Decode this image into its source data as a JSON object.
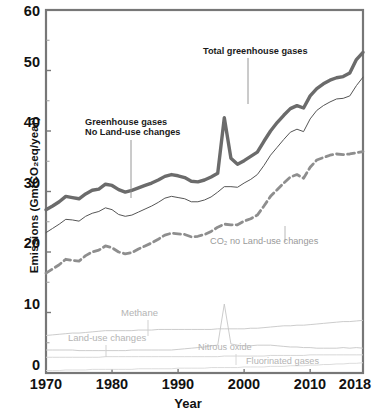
{
  "chart_data": {
    "type": "line",
    "title": "",
    "xlabel": "Year",
    "ylabel": "Emissions (GmtCO₂eq/year)",
    "xlim": [
      1970,
      2018
    ],
    "ylim": [
      0,
      60
    ],
    "yticks": [
      0,
      10,
      20,
      30,
      40,
      50,
      60
    ],
    "xticks": [
      1970,
      1980,
      1990,
      2000,
      2010,
      2018
    ],
    "grid": false,
    "legend": "inline annotations",
    "annotations": [
      {
        "name": "total-greenhouse-gases",
        "text": "Total greenhouse gases",
        "style": "dark"
      },
      {
        "name": "greenhouse-gases-no-landuse",
        "text": "Greenhouse gases\nNo Land-use changes",
        "style": "dark"
      },
      {
        "name": "co2-no-landuse",
        "text": "CO₂ no Land-use changes",
        "style": "gray"
      },
      {
        "name": "methane",
        "text": "Methane",
        "style": "graylight"
      },
      {
        "name": "land-use-changes",
        "text": "Land-use changes",
        "style": "graylight"
      },
      {
        "name": "nitrous-oxide",
        "text": "Nitrous oxide",
        "style": "graylight"
      },
      {
        "name": "fluorinated-gases",
        "text": "Fluorinated gases",
        "style": "graylight"
      }
    ],
    "x": [
      1970,
      1971,
      1972,
      1973,
      1974,
      1975,
      1976,
      1977,
      1978,
      1979,
      1980,
      1981,
      1982,
      1983,
      1984,
      1985,
      1986,
      1987,
      1988,
      1989,
      1990,
      1991,
      1992,
      1993,
      1994,
      1995,
      1996,
      1997,
      1998,
      1999,
      2000,
      2001,
      2002,
      2003,
      2004,
      2005,
      2006,
      2007,
      2008,
      2009,
      2010,
      2011,
      2012,
      2013,
      2014,
      2015,
      2016,
      2017,
      2018
    ],
    "series": [
      {
        "name": "Total greenhouse gases",
        "style": "thick-solid",
        "color": "#6b6b6b",
        "values": [
          27.0,
          27.6,
          28.3,
          29.2,
          29.0,
          28.8,
          29.6,
          30.2,
          30.4,
          31.2,
          31.0,
          30.3,
          29.9,
          30.2,
          30.6,
          31.0,
          31.4,
          31.9,
          32.5,
          32.8,
          32.6,
          32.3,
          31.7,
          31.6,
          31.9,
          32.4,
          33.0,
          42.2,
          35.5,
          34.5,
          35.1,
          35.8,
          36.5,
          38.3,
          40.0,
          41.4,
          42.6,
          43.7,
          44.2,
          43.8,
          45.8,
          47.0,
          47.8,
          48.4,
          48.8,
          49.0,
          49.6,
          51.8,
          53.0
        ]
      },
      {
        "name": "CO₂ + other gases (no land-use)",
        "style": "thin-solid",
        "color": "#555555",
        "values": [
          23.2,
          23.9,
          24.6,
          25.4,
          25.3,
          25.1,
          25.9,
          26.4,
          26.7,
          27.3,
          27.0,
          26.2,
          25.9,
          26.1,
          26.6,
          27.1,
          27.6,
          28.2,
          28.9,
          29.2,
          29.0,
          28.8,
          28.3,
          28.3,
          28.6,
          29.1,
          29.9,
          30.8,
          30.8,
          30.7,
          31.4,
          32.0,
          32.8,
          34.3,
          36.0,
          37.3,
          38.6,
          39.8,
          40.3,
          39.9,
          42.0,
          43.4,
          44.2,
          44.8,
          45.3,
          45.4,
          45.8,
          47.5,
          48.9
        ]
      },
      {
        "name": "CO₂ no Land-use changes",
        "style": "dashed",
        "color": "#8e8e8e",
        "values": [
          16.5,
          17.2,
          17.9,
          18.8,
          18.6,
          18.5,
          19.4,
          20.0,
          20.3,
          21.0,
          20.7,
          20.0,
          19.7,
          19.9,
          20.5,
          21.0,
          21.5,
          22.1,
          22.8,
          23.1,
          23.0,
          22.9,
          22.5,
          22.6,
          22.9,
          23.4,
          24.1,
          24.6,
          24.5,
          24.5,
          25.1,
          25.5,
          26.1,
          27.6,
          29.2,
          30.3,
          31.4,
          32.4,
          32.8,
          32.2,
          34.0,
          35.2,
          35.6,
          36.0,
          36.2,
          36.1,
          36.2,
          36.4,
          36.6
        ]
      },
      {
        "name": "Methane",
        "style": "thin-light",
        "color": "#c6c6c6",
        "values": [
          6.2,
          6.3,
          6.4,
          6.5,
          6.6,
          6.6,
          6.7,
          6.8,
          6.9,
          7.0,
          7.0,
          7.0,
          7.0,
          7.0,
          7.1,
          7.1,
          7.1,
          7.2,
          7.2,
          7.2,
          7.2,
          7.2,
          7.2,
          7.2,
          7.2,
          7.2,
          7.3,
          7.3,
          7.3,
          7.3,
          7.3,
          7.4,
          7.4,
          7.5,
          7.6,
          7.7,
          7.8,
          7.8,
          7.9,
          7.9,
          8.0,
          8.1,
          8.2,
          8.3,
          8.4,
          8.5,
          8.5,
          8.6,
          8.7
        ]
      },
      {
        "name": "Land-use changes",
        "style": "thin-light",
        "color": "#c6c6c6",
        "values": [
          3.8,
          3.8,
          3.8,
          3.8,
          3.8,
          3.7,
          3.7,
          3.7,
          3.7,
          3.7,
          3.7,
          3.7,
          3.7,
          3.8,
          3.8,
          3.8,
          3.8,
          3.8,
          3.8,
          3.8,
          3.9,
          4.0,
          4.1,
          4.2,
          4.3,
          4.5,
          4.6,
          11.4,
          4.8,
          4.6,
          4.5,
          4.5,
          4.6,
          4.6,
          4.6,
          4.5,
          4.4,
          4.3,
          4.3,
          4.2,
          4.2,
          4.1,
          4.1,
          4.1,
          4.1,
          4.2,
          4.1,
          4.2,
          4.1
        ]
      },
      {
        "name": "Nitrous oxide",
        "style": "thin-light",
        "color": "#d2d2d2",
        "values": [
          2.6,
          2.6,
          2.6,
          2.6,
          2.6,
          2.6,
          2.6,
          2.6,
          2.6,
          2.7,
          2.7,
          2.7,
          2.7,
          2.7,
          2.7,
          2.7,
          2.7,
          2.7,
          2.7,
          2.7,
          2.7,
          2.7,
          2.7,
          2.7,
          2.7,
          2.7,
          2.7,
          2.8,
          2.8,
          2.8,
          2.8,
          2.8,
          2.8,
          2.8,
          2.9,
          2.9,
          2.9,
          2.9,
          2.9,
          2.9,
          3.0,
          3.0,
          3.0,
          3.0,
          3.0,
          3.0,
          3.0,
          3.0,
          3.0
        ]
      },
      {
        "name": "Fluorinated gases",
        "style": "thin-light",
        "color": "#d8d8d8",
        "values": [
          0.4,
          0.4,
          0.4,
          0.5,
          0.5,
          0.5,
          0.5,
          0.6,
          0.6,
          0.6,
          0.6,
          0.6,
          0.6,
          0.6,
          0.7,
          0.7,
          0.7,
          0.7,
          0.7,
          0.7,
          0.8,
          0.8,
          0.8,
          0.8,
          0.8,
          0.9,
          0.9,
          0.9,
          0.9,
          0.9,
          1.0,
          1.0,
          1.0,
          1.0,
          1.1,
          1.1,
          1.1,
          1.2,
          1.2,
          1.2,
          1.3,
          1.3,
          1.4,
          1.4,
          1.5,
          1.5,
          1.6,
          1.6,
          1.7
        ]
      }
    ]
  },
  "axis": {
    "ytick_labels": [
      "60",
      "50",
      "40",
      "30",
      "20",
      "10",
      "0"
    ],
    "xtick_labels": [
      "1970",
      "1980",
      "1990",
      "2000",
      "2010",
      "2018"
    ],
    "x_title": "Year",
    "y_title": "Emissions (GmtCO₂eq/year)"
  },
  "labels": {
    "total_ghg": "Total greenhouse gases",
    "ghg_no_landuse_1": "Greenhouse gases",
    "ghg_no_landuse_2": "No Land-use changes",
    "co2_no_landuse": "CO₂ no Land-use changes",
    "methane": "Methane",
    "land_use_changes": "Land-use changes",
    "nitrous_oxide": "Nitrous oxide",
    "fluorinated_gases": "Fluorinated gases"
  },
  "colors": {
    "frame": "#777777",
    "thick_line": "#6b6b6b",
    "thin_line": "#555555",
    "dashed_line": "#8e8e8e",
    "faint_line": "#c8c8c8",
    "text": "#111111"
  }
}
